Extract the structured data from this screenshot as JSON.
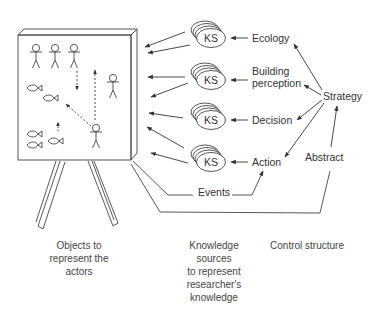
{
  "diagram": {
    "board": {
      "title": "actors-board"
    },
    "knowledge_sources": [
      {
        "label": "KS",
        "feeds_from": "Ecology"
      },
      {
        "label": "KS",
        "feeds_from": "Building perception"
      },
      {
        "label": "KS",
        "feeds_from": "Decision"
      },
      {
        "label": "KS",
        "feeds_from": "Action"
      }
    ],
    "control_nodes": {
      "ecology": "Ecology",
      "building_line1": "Building",
      "building_line2": "perception",
      "decision": "Decision",
      "action": "Action",
      "strategy": "Strategy",
      "abstract": "Abstract",
      "events": "Events"
    },
    "captions": {
      "objects": [
        "Objects to",
        "represent the",
        "actors"
      ],
      "knowledge": [
        "Knowledge",
        "sources",
        "to represent",
        "researcher's",
        "knowledge"
      ],
      "control": [
        "Control structure"
      ]
    },
    "colors": {
      "line": "#444444",
      "text": "#333333",
      "background": "#ffffff"
    }
  }
}
